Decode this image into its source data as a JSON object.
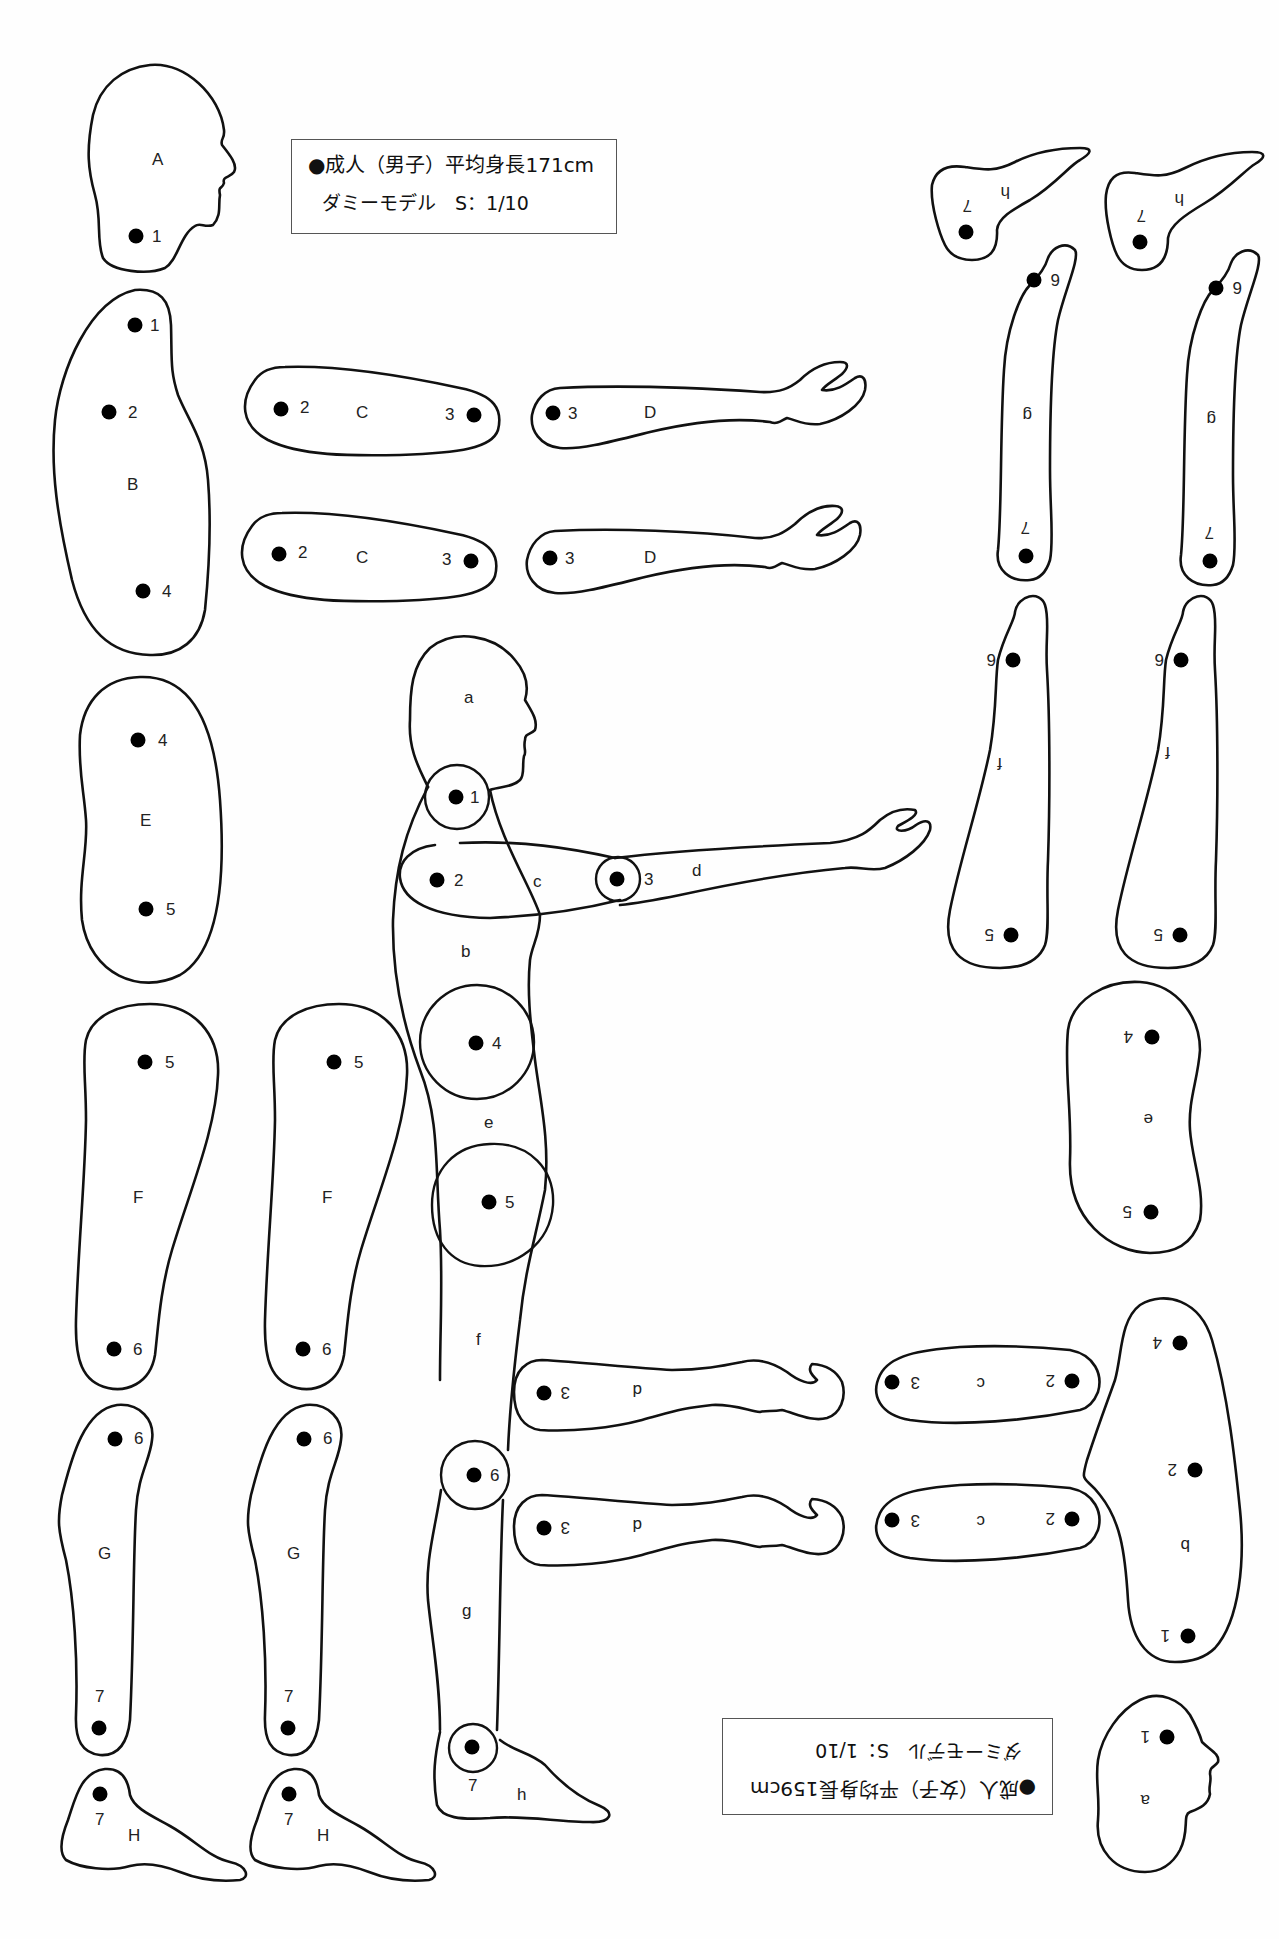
{
  "male_legend": {
    "line1": "●成人（男子）平均身長171cm",
    "line2": "ダミーモデル　S：1/10"
  },
  "female_legend": {
    "line1": "●成人（女子）平均身長159cm",
    "line2": "ダミーモデル　S：1/10",
    "orientation": "rotated 180°"
  },
  "male_parts": {
    "A": {
      "label": "A",
      "name": "head",
      "pivots": [
        "1"
      ]
    },
    "B": {
      "label": "B",
      "name": "torso",
      "pivots": [
        "1",
        "2",
        "4"
      ]
    },
    "C": {
      "label": "C",
      "name": "upper-arm",
      "count": 2,
      "pivots": [
        "2",
        "3"
      ]
    },
    "D": {
      "label": "D",
      "name": "forearm-hand",
      "count": 2,
      "pivots": [
        "3"
      ]
    },
    "E": {
      "label": "E",
      "name": "hip",
      "pivots": [
        "4",
        "5"
      ]
    },
    "F": {
      "label": "F",
      "name": "thigh",
      "count": 2,
      "pivots": [
        "5",
        "6"
      ]
    },
    "G": {
      "label": "G",
      "name": "shin",
      "count": 2,
      "pivots": [
        "6",
        "7"
      ]
    },
    "H": {
      "label": "H",
      "name": "foot",
      "count": 2,
      "pivots": [
        "7"
      ]
    }
  },
  "assembled_figure": {
    "labels": [
      "a",
      "b",
      "c",
      "d",
      "e",
      "f",
      "g",
      "h"
    ],
    "joints": [
      "1",
      "2",
      "3",
      "4",
      "5",
      "6",
      "7"
    ]
  },
  "female_parts": {
    "a": {
      "label": "a",
      "pivots": [
        "1"
      ]
    },
    "b": {
      "label": "b",
      "pivots": [
        "1",
        "2",
        "4"
      ]
    },
    "c": {
      "label": "c",
      "count": 2,
      "pivots": [
        "2",
        "3"
      ]
    },
    "d": {
      "label": "d",
      "count": 2,
      "pivots": [
        "3"
      ]
    },
    "e": {
      "label": "e",
      "pivots": [
        "4",
        "5"
      ]
    },
    "f": {
      "label": "f",
      "count": 2,
      "pivots": [
        "5",
        "6"
      ]
    },
    "g": {
      "label": "g",
      "count": 2,
      "pivots": [
        "6",
        "7"
      ]
    },
    "h": {
      "label": "h",
      "count": 2,
      "pivots": [
        "7"
      ]
    }
  },
  "colors": {
    "line": "#111111",
    "background": "#ffffff"
  }
}
